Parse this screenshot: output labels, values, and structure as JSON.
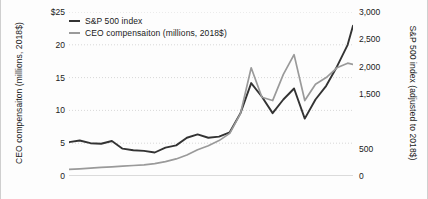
{
  "chart_data": {
    "type": "line",
    "title": "",
    "xlabel": "",
    "grid": "horizontal-dotted",
    "legend_position": "top-left-inside",
    "axes": {
      "left": {
        "label": "CEO compensaiton (millions, 2018$)",
        "ticks": [
          "$25",
          "20",
          "15",
          "10",
          "5",
          "0"
        ],
        "tick_values": [
          25,
          20,
          15,
          10,
          5,
          0
        ],
        "ylim": [
          0,
          25
        ]
      },
      "right": {
        "label": "S&P 500 index (adjusted to 2018$)",
        "ticks": [
          "3,000",
          "2,500",
          "2,000",
          "1,500",
          "500",
          "0"
        ],
        "tick_values": [
          3000,
          2500,
          2000,
          1500,
          500,
          0
        ],
        "ylim": [
          0,
          3000
        ]
      }
    },
    "x": [
      1965,
      1967,
      1969,
      1971,
      1973,
      1975,
      1977,
      1979,
      1981,
      1983,
      1985,
      1987,
      1989,
      1991,
      1993,
      1995,
      1997,
      1999,
      2001,
      2003,
      2005,
      2007,
      2009,
      2011,
      2013,
      2015,
      2017,
      2018
    ],
    "series": [
      {
        "name": "S&P 500 index",
        "axis": "right",
        "color": "#333333",
        "values": [
          620,
          650,
          600,
          590,
          640,
          500,
          470,
          460,
          430,
          520,
          560,
          700,
          760,
          700,
          720,
          800,
          1150,
          1700,
          1450,
          1150,
          1400,
          1600,
          1050,
          1400,
          1650,
          2000,
          2400,
          2750
        ]
      },
      {
        "name": "CEO compensaiton (millions, 2018$)",
        "axis": "left",
        "color": "#9a9a9a",
        "values": [
          1.0,
          1.1,
          1.2,
          1.3,
          1.4,
          1.5,
          1.6,
          1.7,
          1.9,
          2.2,
          2.6,
          3.2,
          4.0,
          4.6,
          5.4,
          6.5,
          9.5,
          16.5,
          12.0,
          11.5,
          15.5,
          18.5,
          11.5,
          14.0,
          15.0,
          16.5,
          17.2,
          17.0
        ]
      }
    ]
  }
}
